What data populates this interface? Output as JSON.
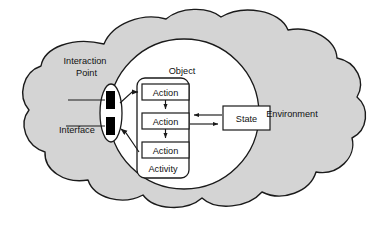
{
  "diagram": {
    "type": "concept-diagram",
    "colors": {
      "cloud_fill": "#d4d4d4",
      "cloud_stroke": "#1a1a1a",
      "circle_fill": "#ffffff",
      "circle_stroke": "#1a1a1a",
      "box_fill": "#ffffff",
      "box_stroke": "#1a1a1a",
      "interaction_point_fill": "#000000",
      "text": "#111111",
      "page_background": "#ffffff"
    },
    "labels": {
      "environment": "Environment",
      "object": "Object",
      "activity": "Activity",
      "state": "State",
      "interaction_point": "Interaction\nPoint",
      "interaction_point_line1": "Interaction",
      "interaction_point_line2": "Point",
      "interface": "Interface"
    },
    "actions": [
      {
        "label": "Action"
      },
      {
        "label": "Action"
      },
      {
        "label": "Action"
      }
    ],
    "connections": [
      {
        "from": "interaction-point-upper",
        "to": "action-1",
        "kind": "arrow"
      },
      {
        "from": "action-1",
        "to": "action-2",
        "kind": "arrow"
      },
      {
        "from": "action-2",
        "to": "action-3",
        "kind": "arrow"
      },
      {
        "from": "state",
        "to": "action-2",
        "kind": "arrow"
      },
      {
        "from": "action-2",
        "to": "state",
        "kind": "arrow"
      },
      {
        "from": "action-3",
        "to": "interaction-point-lower",
        "kind": "arrow"
      },
      {
        "from": "interface-label",
        "to": "interaction-point-lower",
        "kind": "leader-line"
      },
      {
        "from": "interaction-point-label",
        "to": "interaction-point-upper",
        "kind": "leader-line"
      }
    ]
  }
}
